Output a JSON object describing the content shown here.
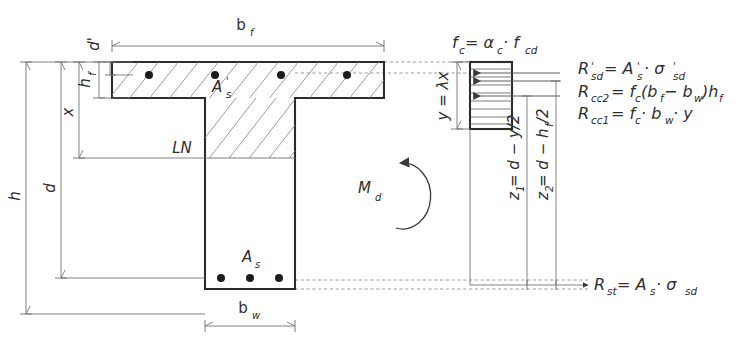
{
  "figure": {
    "section_labels": {
      "flange_width": "b",
      "flange_width_sub": "f",
      "web_width": "b",
      "web_width_sub": "w",
      "flange_depth": "h",
      "flange_depth_sub": "f",
      "cover_top": "d'",
      "neutral_axis_depth": "x",
      "effective_depth": "d",
      "total_depth": "h",
      "neutral_axis": "LN",
      "compression_steel": "A",
      "compression_steel_sub": "s",
      "compression_steel_prime": "'",
      "tension_steel": "A",
      "tension_steel_sub": "s",
      "moment": "M",
      "moment_sub": "d"
    },
    "stress_block": {
      "stress_label": "f",
      "stress_label_sub": "c",
      "stress_equation": " = α",
      "stress_alpha_sub": "c",
      "stress_equation_tail": " · f",
      "stress_fcd_sub": "cd",
      "depth_label": "y = λx"
    },
    "lever_arms": [
      {
        "name": "z",
        "sub": "1",
        "expr": " = d − y/2"
      },
      {
        "name": "z",
        "sub": "2",
        "expr": " = d − h",
        "expr_sub": "f",
        "expr_tail": "/2"
      }
    ],
    "resultant_equations": [
      {
        "id": "Rsd",
        "text": "R'sd = A's · σ'sd"
      },
      {
        "id": "Rcc2",
        "text": "Rcc2 = fc (bf − bw)hf"
      },
      {
        "id": "Rcc1",
        "text": "Rcc1 = fc · bw · y"
      },
      {
        "id": "Rst",
        "text": "Rst = As · σsd"
      }
    ],
    "rebar_counts": {
      "compression": 4,
      "tension": 3
    },
    "colors": {
      "outline": "#2b2b2b",
      "hatch": "#8a8a8a",
      "dimension": "#6d6d6d",
      "dashed": "#8d8d8d",
      "rebar": "#1c1c1c",
      "text": "#2e2e2e",
      "background": "#ffffff"
    }
  }
}
